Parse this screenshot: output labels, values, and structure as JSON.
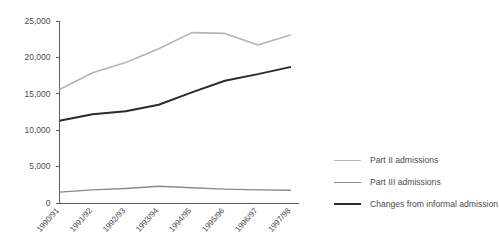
{
  "chart_data": {
    "type": "line",
    "title": "",
    "subtitle": "",
    "xlabel": "",
    "ylabel": "",
    "grid": false,
    "legend_position": "right",
    "categories": [
      "1990/91",
      "1991/92",
      "1992/93",
      "1993/94",
      "1994/95",
      "1995/96",
      "1996/97",
      "1997/98"
    ],
    "ylim": [
      0,
      25000
    ],
    "yticks": [
      0,
      5000,
      10000,
      15000,
      20000,
      25000
    ],
    "ytick_labels": [
      "0",
      "5,000",
      "10,000",
      "15,000",
      "20,000",
      "25,000"
    ],
    "series": [
      {
        "name": "Part II admissions",
        "color": "#b4b4b4",
        "width": 1.6,
        "values": [
          15600,
          17900,
          19300,
          21200,
          23400,
          23300,
          21700,
          23100
        ]
      },
      {
        "name": "Part III admissions",
        "color": "#8a8a8a",
        "width": 1.4,
        "values": [
          1500,
          1800,
          2000,
          2300,
          2100,
          1900,
          1800,
          1750
        ]
      },
      {
        "name": "Changes from informal admission",
        "color": "#2b2b2b",
        "width": 2.0,
        "values": [
          11300,
          12200,
          12600,
          13500,
          15200,
          16800,
          17700,
          18700
        ]
      }
    ]
  },
  "legend": {
    "items": [
      {
        "label": "Part II admissions",
        "color": "#b4b4b4",
        "width": 1.6
      },
      {
        "label": "Part III admissions",
        "color": "#8a8a8a",
        "width": 1.8
      },
      {
        "label": "Changes from informal admission",
        "color": "#2b2b2b",
        "width": 2.4
      }
    ]
  }
}
